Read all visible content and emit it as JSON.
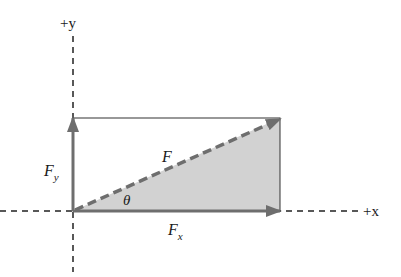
{
  "diagram": {
    "axes": {
      "x_label": "+x",
      "y_label": "+y"
    },
    "vectors": {
      "resultant": {
        "symbol": "F"
      },
      "x_component": {
        "symbol": "F",
        "subscript": "x"
      },
      "y_component": {
        "symbol": "F",
        "subscript": "y"
      }
    },
    "angle": {
      "symbol": "θ"
    },
    "colors": {
      "vector": "#6e6e6e",
      "shading": "#d2d2d2",
      "axis": "#222222",
      "rectangle": "#333333"
    }
  }
}
